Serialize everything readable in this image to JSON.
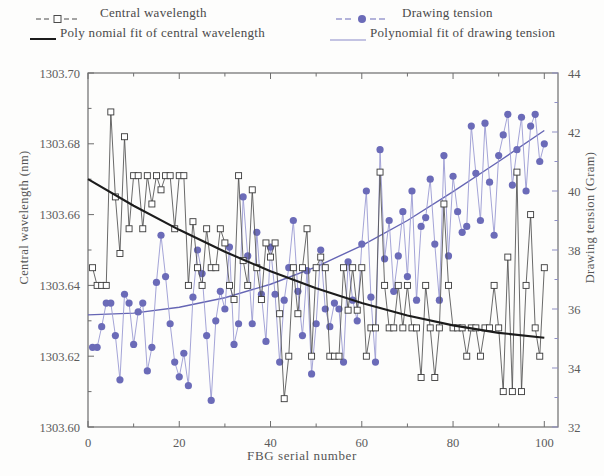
{
  "figure": {
    "width": 604,
    "height": 476,
    "background": "#fdfdfc"
  },
  "legend": {
    "entries": [
      {
        "label": "Central wavelength",
        "marker": "open-square",
        "color": "#3a3a3a",
        "style": "dashed-marker"
      },
      {
        "label": "Drawing tension",
        "marker": "filled-circle",
        "color": "#6b6bb8",
        "style": "dashed-marker"
      },
      {
        "label": "Poly nomial fit of central wavelength",
        "marker": "none",
        "color": "#2b2b2b",
        "style": "solid-line"
      },
      {
        "label": "Polynomial fit of drawing tension",
        "marker": "none",
        "color": "#6b6bb8",
        "style": "solid-line"
      }
    ]
  },
  "chart_data": {
    "type": "line",
    "title": "",
    "xlabel": "FBG serial number",
    "ylabel": "Central wavelength (nm)",
    "ylabel_right": "Drawing tension (Gram)",
    "xlim": [
      0,
      103
    ],
    "ylim": [
      1303.6,
      1303.7
    ],
    "ylim_right": [
      32,
      44
    ],
    "xticks": [
      0,
      20,
      40,
      60,
      80,
      100
    ],
    "xtick_labels": [
      "0",
      "20",
      "40",
      "60",
      "80",
      "100"
    ],
    "xminor_interval": 10,
    "yticks": [
      1303.6,
      1303.62,
      1303.64,
      1303.66,
      1303.68,
      1303.7
    ],
    "ytick_labels": [
      "1303.60",
      "1303.62",
      "1303.64",
      "1303.66",
      "1303.68",
      "1303.70"
    ],
    "yminor_interval": 0.01,
    "yticks_right": [
      32,
      34,
      36,
      38,
      40,
      42,
      44
    ],
    "ytick_labels_right": [
      "32",
      "34",
      "36",
      "38",
      "40",
      "42",
      "44"
    ],
    "yminor_interval_right": 1,
    "grid": false,
    "legend_position": "above-axes",
    "colors": {
      "central_wavelength": "#3a3a3a",
      "drawing_tension": "#6b6bb8",
      "fit_wavelength": "#1c1c1c",
      "fit_tension": "#6565b4",
      "axis": "#6d6d6d"
    },
    "series": [
      {
        "name": "Central wavelength",
        "axis": "left",
        "marker": "open-square",
        "x": [
          1,
          2,
          3,
          4,
          5,
          6,
          7,
          8,
          9,
          10,
          11,
          12,
          13,
          14,
          15,
          16,
          17,
          18,
          19,
          20,
          21,
          22,
          23,
          24,
          25,
          26,
          27,
          28,
          29,
          30,
          31,
          32,
          33,
          34,
          35,
          36,
          37,
          38,
          39,
          40,
          41,
          42,
          43,
          44,
          45,
          46,
          47,
          48,
          49,
          50,
          51,
          52,
          53,
          54,
          55,
          56,
          57,
          58,
          59,
          60,
          61,
          62,
          63,
          64,
          65,
          66,
          67,
          68,
          69,
          70,
          71,
          72,
          73,
          74,
          75,
          76,
          77,
          78,
          79,
          80,
          81,
          82,
          83,
          84,
          85,
          86,
          87,
          88,
          89,
          90,
          91,
          92,
          93,
          94,
          95,
          96,
          97,
          98,
          99,
          100
        ],
        "values": [
          1303.645,
          1303.64,
          1303.64,
          1303.64,
          1303.689,
          1303.665,
          1303.649,
          1303.682,
          1303.656,
          1303.671,
          1303.671,
          1303.656,
          1303.671,
          1303.663,
          1303.671,
          1303.667,
          1303.671,
          1303.671,
          1303.656,
          1303.671,
          1303.671,
          1303.64,
          1303.658,
          1303.645,
          1303.64,
          1303.656,
          1303.645,
          1303.645,
          1303.656,
          1303.652,
          1303.64,
          1303.636,
          1303.671,
          1303.647,
          1303.64,
          1303.667,
          1303.645,
          1303.636,
          1303.652,
          1303.648,
          1303.652,
          1303.632,
          1303.608,
          1303.62,
          1303.645,
          1303.632,
          1303.645,
          1303.656,
          1303.62,
          1303.645,
          1303.648,
          1303.645,
          1303.62,
          1303.62,
          1303.62,
          1303.645,
          1303.633,
          1303.645,
          1303.633,
          1303.645,
          1303.62,
          1303.628,
          1303.628,
          1303.672,
          1303.64,
          1303.628,
          1303.628,
          1303.64,
          1303.628,
          1303.64,
          1303.628,
          1303.628,
          1303.614,
          1303.64,
          1303.628,
          1303.614,
          1303.628,
          1303.663,
          1303.64,
          1303.628,
          1303.628,
          1303.628,
          1303.62,
          1303.628,
          1303.628,
          1303.62,
          1303.628,
          1303.628,
          1303.64,
          1303.628,
          1303.61,
          1303.648,
          1303.61,
          1303.672,
          1303.61,
          1303.64,
          1303.66,
          1303.628,
          1303.62,
          1303.645
        ]
      },
      {
        "name": "Drawing tension",
        "axis": "right",
        "marker": "filled-circle",
        "x": [
          1,
          2,
          3,
          4,
          5,
          6,
          7,
          8,
          9,
          10,
          11,
          12,
          13,
          14,
          15,
          16,
          17,
          18,
          19,
          20,
          21,
          22,
          23,
          24,
          25,
          26,
          27,
          28,
          29,
          30,
          31,
          32,
          33,
          34,
          35,
          36,
          37,
          38,
          39,
          40,
          41,
          42,
          43,
          44,
          45,
          46,
          47,
          48,
          49,
          50,
          51,
          52,
          53,
          54,
          55,
          56,
          57,
          58,
          59,
          60,
          61,
          62,
          63,
          64,
          65,
          66,
          67,
          68,
          69,
          70,
          71,
          72,
          73,
          74,
          75,
          76,
          77,
          78,
          79,
          80,
          81,
          82,
          83,
          84,
          85,
          86,
          87,
          88,
          89,
          90,
          91,
          92,
          93,
          94,
          95,
          96,
          97,
          98,
          99,
          100
        ],
        "values": [
          34.7,
          34.7,
          35.4,
          36.2,
          36.2,
          35.1,
          33.6,
          36.5,
          36.2,
          34.8,
          35.9,
          36.2,
          33.9,
          34.7,
          36.9,
          38.5,
          37.1,
          35.5,
          34.2,
          33.7,
          34.5,
          33.4,
          36.4,
          38.0,
          37.2,
          35.1,
          32.9,
          35.6,
          36.6,
          36.0,
          38.1,
          34.8,
          35.5,
          39.8,
          37.8,
          35.5,
          38.6,
          36.5,
          34.9,
          38.1,
          36.5,
          34.2,
          36.3,
          37.4,
          39.0,
          36.6,
          35.1,
          37.3,
          33.8,
          35.5,
          38.0,
          36.0,
          35.4,
          36.2,
          36.0,
          34.2,
          37.6,
          36.3,
          35.6,
          38.2,
          40.0,
          36.4,
          34.2,
          41.4,
          37.7,
          39.0,
          36.6,
          37.8,
          39.3,
          37.1,
          40.0,
          36.3,
          38.8,
          39.1,
          40.4,
          38.2,
          36.3,
          41.2,
          37.8,
          40.5,
          39.3,
          38.6,
          38.8,
          42.2,
          40.6,
          39.0,
          42.3,
          40.3,
          38.5,
          41.2,
          41.9,
          42.6,
          40.2,
          41.4,
          42.5,
          40.0,
          42.2,
          42.6,
          41.0,
          41.6
        ]
      }
    ],
    "fits": [
      {
        "name": "Poly nomial fit of central wavelength",
        "axis": "left",
        "type": "polynomial",
        "degree": 2,
        "endpoints": {
          "x0": 0,
          "y0": 1303.67,
          "x100": 100,
          "y100": 1303.625
        },
        "vertex": {
          "x": 88,
          "y": 1303.6243
        },
        "sample_x": [
          0,
          10,
          20,
          30,
          40,
          50,
          60,
          70,
          80,
          90,
          100
        ],
        "sample_y": [
          1303.67,
          1303.6625,
          1303.6557,
          1303.6495,
          1303.644,
          1303.6392,
          1303.635,
          1303.6315,
          1303.6287,
          1303.6266,
          1303.6252
        ]
      },
      {
        "name": "Polynomial fit of drawing tension",
        "axis": "right",
        "type": "polynomial",
        "degree": 2,
        "endpoints": {
          "x0": 0,
          "y0": 35.8,
          "x100": 100,
          "y100": 42.0
        },
        "sample_x": [
          0,
          10,
          20,
          30,
          40,
          50,
          60,
          70,
          80,
          90,
          100
        ],
        "sample_y": [
          35.8,
          35.86,
          36.06,
          36.38,
          36.84,
          37.43,
          38.15,
          39.0,
          39.98,
          41.0,
          42.05
        ]
      }
    ]
  }
}
